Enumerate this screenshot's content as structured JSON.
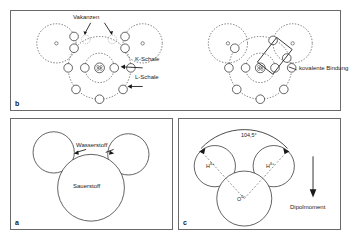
{
  "figure": {
    "background_color": "#ffffff",
    "stroke_color": "#3a3a3a",
    "panel_border_color": "#6a6a6a"
  },
  "panels": {
    "b": {
      "letter": "b",
      "labels": {
        "vacancies": "Vakanzen",
        "k_shell": "K-Schale",
        "l_shell": "L-Schale",
        "covalent_bond": "kovalente Bindung"
      },
      "left_diagram": {
        "description": "Sauerstoffatom mit K-Schale und L-Schale, zwei Vakanzen, zwei Wasserstoffatome",
        "shells": [
          "K-Schale",
          "L-Schale"
        ],
        "k_shell_electrons": 2,
        "l_shell_electrons": 6,
        "vacancy_count": 2,
        "hydrogen_count": 2
      },
      "right_diagram": {
        "description": "Gleiche Anordnung mit kovalenten Bindungen, Elektronenpaar im Rechteck markiert",
        "shells": [
          "K-Schale",
          "L-Schale"
        ],
        "k_shell_electrons": 2,
        "l_shell_electrons": 8,
        "bond_box_count": 1,
        "hydrogen_count": 2
      }
    },
    "a": {
      "letter": "a",
      "labels": {
        "hydrogen": "Wasserstoff",
        "oxygen": "Sauerstoff"
      },
      "atoms": [
        {
          "name": "Wasserstoff",
          "role": "hydrogen",
          "relative_radius": 0.46
        },
        {
          "name": "Wasserstoff",
          "role": "hydrogen",
          "relative_radius": 0.46
        },
        {
          "name": "Sauerstoff",
          "role": "oxygen",
          "relative_radius": 1.0
        }
      ]
    },
    "c": {
      "letter": "c",
      "labels": {
        "angle": "104,5°",
        "hydrogen_left": "H",
        "hydrogen_left_charge": "δ+",
        "hydrogen_right": "H",
        "hydrogen_right_charge": "δ+",
        "oxygen": "O",
        "oxygen_charge": "δ−",
        "dipole": "Dipolmoment"
      },
      "bond_angle_degrees": 104.5,
      "dipole_direction": "down"
    }
  }
}
